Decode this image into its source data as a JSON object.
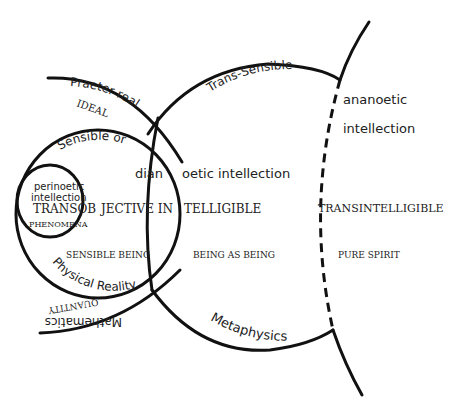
{
  "diagram": {
    "regions": {
      "praeter_real": "Praeter real",
      "ideal": "IDEAL",
      "sensible_or": "Sensible or",
      "physical_reality": "Physical Reality",
      "mathematics": "Mathematics",
      "quantity": "QUANTITY",
      "trans_sensible": "Trans-Sensible",
      "metaphysics": "Metaphysics"
    },
    "intellection": {
      "perinoetic": "perinoetic",
      "perinoetic_2": "intellection",
      "dian": "dian",
      "oetic": "oetic intellection",
      "ananoetic": "ananoetic",
      "ananoetic_2": "intellection"
    },
    "intelligibility": {
      "transob": "TRANSOB",
      "jective_in": "JECTIVE IN",
      "telligible": "TELLIGIBLE",
      "transintelligible": "TRANSINTELLIGIBLE"
    },
    "being": {
      "phenomena": "PHENOMENA",
      "sensible_being": "SENSIBLE BEING",
      "being_as_being": "BEING AS BEING",
      "pure_spirit": "PURE SPIRIT"
    }
  }
}
